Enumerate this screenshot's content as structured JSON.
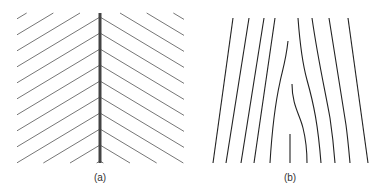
{
  "figure": {
    "panels": [
      {
        "id": "a",
        "label": "(a)",
        "description": "Herringbone pattern: thick vertical spine with parallel diagonal lines meeting it in chevrons",
        "spine": {
          "x": 100,
          "y1": 13,
          "y2": 163,
          "width": 3,
          "color": "#444444"
        },
        "line_color": "#777777",
        "chevron_y_at_spine": [
          17,
          33,
          49,
          65,
          81,
          97,
          113,
          129,
          146
        ],
        "left_edge_x": 17,
        "right_edge_x": 184
      },
      {
        "id": "b",
        "label": "(b)",
        "description": "Fringe pattern with a fork (edge dislocation): nearly vertical curved lines with a line terminating in the middle",
        "line_color": "#222222",
        "lines": [
          {
            "d": "M233,18 L213,163"
          },
          {
            "d": "M249,18 L226,163"
          },
          {
            "d": "M264,18 L241,163"
          },
          {
            "d": "M275,18 L254,163"
          },
          {
            "d": "M288,41 C286,60 282,72 280,82 C276,100 272,130 270,163"
          },
          {
            "d": "M290,134 L290,163"
          },
          {
            "d": "M292,84 C292,105 300,115 303,128 C306,140 307,152 307,163"
          },
          {
            "d": "M298,18 C300,45 302,62 307,80 C314,105 318,125 321,163"
          },
          {
            "d": "M312,18 C318,60 325,90 330,118 C333,138 334,150 335,163"
          },
          {
            "d": "M329,18 C336,60 342,100 346,125 C348,140 349,152 350,163"
          },
          {
            "d": "M348,18 L368,163"
          }
        ]
      }
    ]
  }
}
